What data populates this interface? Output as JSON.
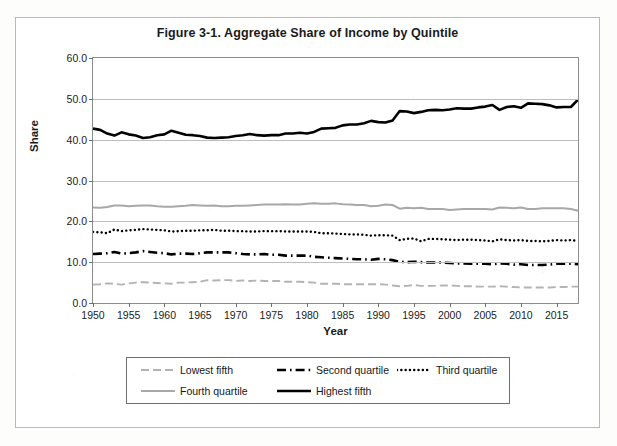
{
  "figure": {
    "title": "Figure 3-1. Aggregate Share of Income by Quintile",
    "y_axis_title": "Share",
    "x_axis_title": "Year"
  },
  "colors": {
    "lowest_fifth": "#b3b3b3",
    "second_quartile": "#000000",
    "third_quartile": "#000000",
    "fourth_quartile": "#a8a8a8",
    "highest_fifth": "#000000",
    "gridline": "#bdbdbd",
    "axis": "#8d8d8d",
    "text": "#1a1a1a"
  },
  "legend": {
    "entries": [
      {
        "label": "Lowest fifth",
        "style": "dashed-gray"
      },
      {
        "label": "Second quartile",
        "style": "dash-dot-black"
      },
      {
        "label": "Third quartile",
        "style": "dotted-black"
      },
      {
        "label": "Fourth quartile",
        "style": "solid-gray"
      },
      {
        "label": "Highest fifth",
        "style": "solid-black-thick"
      }
    ]
  },
  "chart_data": {
    "type": "line",
    "title": "Figure 3-1. Aggregate Share of Income by Quintile",
    "xlabel": "Year",
    "ylabel": "Share",
    "xlim": [
      1950,
      2018
    ],
    "ylim": [
      0.0,
      60.0
    ],
    "ytick_labels": [
      "0.0",
      "10.0",
      "20.0",
      "30.0",
      "40.0",
      "50.0",
      "60.0"
    ],
    "ytick_values": [
      0,
      10,
      20,
      30,
      40,
      50,
      60
    ],
    "xtick_labels": [
      "1950",
      "1955",
      "1960",
      "1965",
      "1970",
      "1975",
      "1980",
      "1985",
      "1990",
      "1995",
      "2000",
      "2005",
      "2010",
      "2015"
    ],
    "xtick_values": [
      1950,
      1955,
      1960,
      1965,
      1970,
      1975,
      1980,
      1985,
      1990,
      1995,
      2000,
      2005,
      2010,
      2015
    ],
    "grid": "horizontal",
    "legend_position": "below-plot",
    "x": [
      1950,
      1951,
      1952,
      1953,
      1954,
      1955,
      1956,
      1957,
      1958,
      1959,
      1960,
      1961,
      1962,
      1963,
      1964,
      1965,
      1966,
      1967,
      1968,
      1969,
      1970,
      1971,
      1972,
      1973,
      1974,
      1975,
      1976,
      1977,
      1978,
      1979,
      1980,
      1981,
      1982,
      1983,
      1984,
      1985,
      1986,
      1987,
      1988,
      1989,
      1990,
      1991,
      1992,
      1993,
      1994,
      1995,
      1996,
      1997,
      1998,
      1999,
      2000,
      2001,
      2002,
      2003,
      2004,
      2005,
      2006,
      2007,
      2008,
      2009,
      2010,
      2011,
      2012,
      2013,
      2014,
      2015,
      2016,
      2017,
      2018
    ],
    "series": [
      {
        "name": "Lowest fifth",
        "style": "dashed-gray",
        "values": [
          4.5,
          4.6,
          4.8,
          4.7,
          4.5,
          4.8,
          5.0,
          5.1,
          5.0,
          4.9,
          4.8,
          4.7,
          5.0,
          5.0,
          5.1,
          5.2,
          5.6,
          5.5,
          5.6,
          5.6,
          5.4,
          5.5,
          5.4,
          5.5,
          5.4,
          5.4,
          5.4,
          5.2,
          5.2,
          5.2,
          5.1,
          5.0,
          4.7,
          4.7,
          4.7,
          4.6,
          4.6,
          4.6,
          4.6,
          4.6,
          4.6,
          4.5,
          4.3,
          4.1,
          4.2,
          4.4,
          4.2,
          4.2,
          4.2,
          4.3,
          4.3,
          4.2,
          4.1,
          4.1,
          4.0,
          4.0,
          4.0,
          4.1,
          4.0,
          3.9,
          3.8,
          3.8,
          3.8,
          3.8,
          3.8,
          3.9,
          3.9,
          4.0,
          4.0
        ]
      },
      {
        "name": "Second quartile",
        "style": "dash-dot-black",
        "values": [
          12.0,
          12.1,
          12.2,
          12.5,
          12.1,
          12.2,
          12.4,
          12.7,
          12.5,
          12.3,
          12.2,
          11.9,
          12.1,
          12.1,
          12.0,
          12.2,
          12.4,
          12.4,
          12.4,
          12.4,
          12.2,
          12.0,
          11.9,
          11.9,
          12.0,
          11.8,
          11.8,
          11.6,
          11.6,
          11.6,
          11.6,
          11.3,
          11.2,
          11.1,
          11.0,
          10.9,
          10.8,
          10.7,
          10.7,
          10.6,
          10.8,
          10.7,
          10.5,
          10.1,
          10.0,
          10.1,
          10.0,
          9.9,
          9.9,
          9.9,
          9.8,
          9.7,
          9.7,
          9.6,
          9.6,
          9.6,
          9.5,
          9.7,
          9.6,
          9.4,
          9.5,
          9.3,
          9.3,
          9.3,
          9.4,
          9.6,
          9.6,
          9.6,
          9.5
        ]
      },
      {
        "name": "Third quartile",
        "style": "dotted-black",
        "values": [
          17.4,
          17.3,
          17.1,
          18.0,
          17.6,
          17.8,
          17.9,
          18.1,
          18.0,
          17.9,
          17.8,
          17.5,
          17.6,
          17.7,
          17.7,
          17.8,
          17.8,
          17.9,
          17.7,
          17.7,
          17.6,
          17.6,
          17.5,
          17.5,
          17.6,
          17.6,
          17.6,
          17.5,
          17.5,
          17.5,
          17.5,
          17.4,
          17.1,
          17.1,
          17.0,
          16.9,
          16.8,
          16.8,
          16.7,
          16.5,
          16.6,
          16.6,
          16.5,
          15.4,
          15.7,
          15.8,
          15.1,
          15.7,
          15.7,
          15.6,
          15.5,
          15.4,
          15.5,
          15.5,
          15.4,
          15.3,
          15.1,
          15.6,
          15.4,
          15.3,
          15.4,
          15.2,
          15.2,
          15.1,
          15.2,
          15.4,
          15.3,
          15.4,
          15.2
        ]
      },
      {
        "name": "Fourth quartile",
        "style": "solid-gray",
        "values": [
          23.4,
          23.3,
          23.5,
          23.9,
          23.9,
          23.7,
          23.8,
          23.9,
          23.9,
          23.7,
          23.6,
          23.6,
          23.7,
          23.8,
          24.0,
          23.9,
          23.8,
          23.9,
          23.7,
          23.7,
          23.8,
          23.8,
          23.9,
          24.0,
          24.1,
          24.1,
          24.1,
          24.2,
          24.1,
          24.1,
          24.3,
          24.4,
          24.3,
          24.3,
          24.4,
          24.2,
          24.1,
          24.0,
          24.0,
          23.7,
          23.8,
          24.1,
          24.0,
          23.1,
          23.3,
          23.2,
          23.3,
          23.0,
          23.0,
          23.0,
          22.8,
          22.9,
          23.0,
          23.0,
          23.0,
          23.0,
          22.9,
          23.4,
          23.3,
          23.2,
          23.4,
          23.0,
          23.0,
          23.2,
          23.2,
          23.2,
          23.2,
          23.0,
          22.6
        ]
      },
      {
        "name": "Highest fifth",
        "style": "solid-black-thick",
        "values": [
          42.7,
          42.4,
          41.5,
          41.0,
          41.8,
          41.3,
          41.0,
          40.4,
          40.6,
          41.1,
          41.3,
          42.2,
          41.7,
          41.2,
          41.1,
          40.9,
          40.5,
          40.4,
          40.5,
          40.6,
          40.9,
          41.1,
          41.4,
          41.1,
          41.0,
          41.1,
          41.1,
          41.5,
          41.5,
          41.7,
          41.5,
          41.9,
          42.7,
          42.8,
          42.9,
          43.5,
          43.7,
          43.7,
          44.0,
          44.6,
          44.3,
          44.2,
          44.7,
          47.0,
          46.9,
          46.5,
          46.8,
          47.2,
          47.3,
          47.2,
          47.4,
          47.7,
          47.6,
          47.6,
          47.9,
          48.1,
          48.5,
          47.3,
          48.0,
          48.2,
          47.8,
          48.9,
          48.8,
          48.7,
          48.4,
          47.9,
          48.0,
          48.0,
          49.8
        ]
      }
    ]
  }
}
